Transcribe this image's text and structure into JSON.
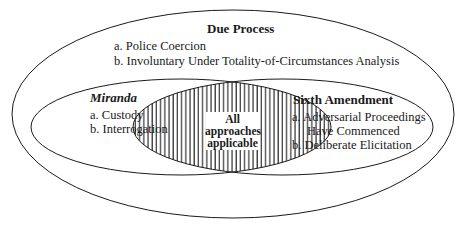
{
  "diagram": {
    "type": "venn",
    "outer_set": {
      "title": "Due Process",
      "items": [
        "a.  Police Coercion",
        "b.  Involuntary Under Totality-of-Circumstances Analysis"
      ]
    },
    "left_set": {
      "title": "Miranda",
      "items": [
        "a.  Custody",
        "b.  Interrogation"
      ]
    },
    "right_set": {
      "title": "Sixth Amendment",
      "items": [
        "a.  Adversarial Proceedings",
        "Have Commenced",
        "b.  Deliberate Elicitation"
      ]
    },
    "intersection": {
      "lines": [
        "All",
        "approaches",
        "applicable"
      ],
      "fill": "vertical-hatch"
    },
    "colors": {
      "stroke": "#1a1a1a",
      "background": "#ffffff"
    }
  }
}
